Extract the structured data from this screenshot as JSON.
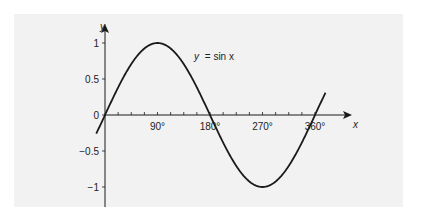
{
  "chart_data": {
    "type": "line",
    "title": "",
    "function": "y = sin x",
    "annotation": {
      "text_y": "y",
      "text_eq": "= sin x",
      "full": "y = sin x"
    },
    "xlabel": "x",
    "ylabel": "y",
    "x_ticks": [
      0,
      90,
      180,
      270,
      360
    ],
    "x_tick_labels": [
      "90°",
      "180°",
      "270°",
      "360°"
    ],
    "x_minor_step": 22.5,
    "y_ticks": [
      1,
      0.5,
      0,
      -0.5,
      -1
    ],
    "y_tick_labels": [
      "1",
      "0.5",
      "0",
      "-0.5",
      "-1"
    ],
    "xlim": [
      -15,
      378
    ],
    "ylim": [
      -1.25,
      1.15
    ],
    "grid": false,
    "legend": "none",
    "series": [
      {
        "name": "y = sin x",
        "x": [
          -15,
          0,
          30,
          60,
          90,
          120,
          150,
          180,
          210,
          240,
          270,
          300,
          330,
          360,
          377
        ],
        "values": [
          -0.26,
          0,
          0.5,
          0.87,
          1,
          0.87,
          0.5,
          0,
          -0.5,
          -0.87,
          -1,
          -0.87,
          -0.5,
          0,
          0.29
        ]
      }
    ],
    "colors": {
      "background": "#ffffff",
      "panel": "#f2f2f2",
      "ink": "#1a1a1a"
    }
  }
}
